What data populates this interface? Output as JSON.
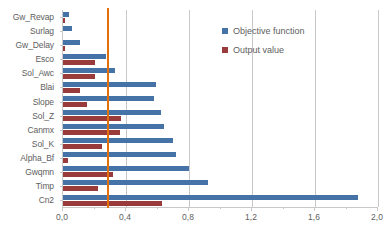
{
  "chart_data": {
    "type": "bar",
    "orientation": "horizontal",
    "title": "",
    "xlabel": "",
    "ylabel": "",
    "xlim": [
      0.0,
      2.0
    ],
    "xticks": [
      "0,0",
      "0,4",
      "0,8",
      "1,2",
      "1,6",
      "2,0"
    ],
    "xtick_values": [
      0.0,
      0.4,
      0.8,
      1.2,
      1.6,
      2.0
    ],
    "minor_tick_step": 0.2,
    "grid": "vertical-major",
    "legend_position": "upper-right-inside",
    "categories": [
      "Gw_Revap",
      "Surlag",
      "Gw_Delay",
      "Esco",
      "Sol_Awc",
      "Blai",
      "Slope",
      "Sol_Z",
      "Canmx",
      "Sol_K",
      "Alpha_Bf",
      "Gwqmn",
      "Timp",
      "Cn2"
    ],
    "series": [
      {
        "name": "Objective function",
        "color": "#4572A7",
        "values": [
          0.04,
          0.06,
          0.11,
          0.27,
          0.33,
          0.59,
          0.58,
          0.62,
          0.64,
          0.7,
          0.72,
          0.8,
          0.92,
          1.87
        ]
      },
      {
        "name": "Output value",
        "color": "#9A3B3B",
        "values": [
          0.015,
          0.0,
          0.01,
          0.2,
          0.2,
          0.11,
          0.15,
          0.37,
          0.36,
          0.25,
          0.03,
          0.32,
          0.22,
          0.63
        ]
      }
    ],
    "annotations": [
      {
        "type": "reference-line",
        "orientation": "vertical",
        "value": 0.28,
        "color": "#E2700B"
      }
    ]
  },
  "legend": {
    "entries": [
      {
        "label": "Objective function",
        "color": "#4572A7"
      },
      {
        "label": "Output value",
        "color": "#9A3B3B"
      }
    ]
  },
  "colors": {
    "objective": "#4572A7",
    "output": "#9A3B3B",
    "reference_line": "#E2700B",
    "grid": "#c8c8c8",
    "text": "#5e5e5e",
    "background": "#ffffff"
  }
}
